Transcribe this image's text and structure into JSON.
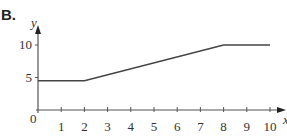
{
  "panel_label": "B.",
  "chart_data": {
    "type": "line",
    "title": "",
    "xlabel": "x",
    "ylabel": "y",
    "origin_label": "0",
    "x_ticks": [
      1,
      2,
      3,
      4,
      5,
      6,
      7,
      8,
      9,
      10
    ],
    "y_ticks": [
      5,
      10
    ],
    "xlim": [
      0,
      10
    ],
    "ylim": [
      0,
      10
    ],
    "grid": false,
    "series": [
      {
        "name": "y",
        "x": [
          0,
          2,
          8,
          10
        ],
        "y": [
          4.5,
          4.5,
          10,
          10
        ]
      }
    ]
  }
}
